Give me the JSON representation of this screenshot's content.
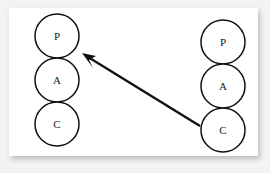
{
  "diagram": {
    "type": "circle-stack-flow",
    "title": "",
    "background_color": "#ffffff",
    "panel_color": "#ffffff",
    "scan_margin_color": "#f3f3f3",
    "stroke_color": "#111111",
    "groups": [
      {
        "name": "left-stack",
        "position": "left",
        "nodes": [
          {
            "label": "P",
            "cx": 57,
            "cy": 36,
            "r": 22
          },
          {
            "label": "A",
            "cx": 57,
            "cy": 80,
            "r": 22
          },
          {
            "label": "C",
            "cx": 57,
            "cy": 124,
            "r": 22
          }
        ]
      },
      {
        "name": "right-stack",
        "position": "right",
        "nodes": [
          {
            "label": "P",
            "cx": 223,
            "cy": 42,
            "r": 22
          },
          {
            "label": "A",
            "cx": 223,
            "cy": 86,
            "r": 22
          },
          {
            "label": "C",
            "cx": 223,
            "cy": 130,
            "r": 22
          }
        ]
      }
    ],
    "connectors": [
      {
        "name": "c-to-p-arrow",
        "from": "right-stack.C",
        "to": "left-stack.P",
        "x1": 200,
        "y1": 126,
        "x2": 84,
        "y2": 55,
        "head": "arrow-head-upper-left",
        "label": ""
      }
    ]
  }
}
